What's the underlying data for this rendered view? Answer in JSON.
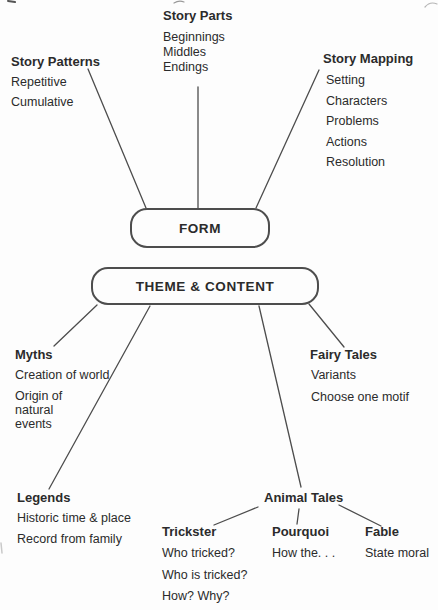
{
  "colors": {
    "text": "#2b2b2b",
    "line": "#4d4d4d",
    "background": "#fdfdfd"
  },
  "diagram": {
    "form": {
      "node": "FORM",
      "story_patterns": {
        "title": "Story Patterns",
        "items": [
          "Repetitive",
          "Cumulative"
        ]
      },
      "story_parts": {
        "title": "Story Parts",
        "items": [
          "Beginnings",
          "Middles",
          "Endings"
        ]
      },
      "story_mapping": {
        "title": "Story Mapping",
        "items": [
          "Setting",
          "Characters",
          "Problems",
          "Actions",
          "Resolution"
        ]
      }
    },
    "theme": {
      "node": "THEME & CONTENT",
      "myths": {
        "title": "Myths",
        "items": [
          "Creation of world",
          "Origin of natural events"
        ]
      },
      "fairy_tales": {
        "title": "Fairy Tales",
        "items": [
          "Variants",
          "Choose one motif"
        ]
      },
      "legends": {
        "title": "Legends",
        "items": [
          "Historic time & place",
          "Record from family"
        ]
      },
      "animal_tales": {
        "title": "Animal Tales",
        "trickster": {
          "title": "Trickster",
          "items": [
            "Who tricked?",
            "Who is tricked?",
            "How? Why?"
          ]
        },
        "pourquoi": {
          "title": "Pourquoi",
          "items": [
            "How the. . ."
          ]
        },
        "fable": {
          "title": "Fable",
          "items": [
            "State moral"
          ]
        }
      }
    }
  }
}
